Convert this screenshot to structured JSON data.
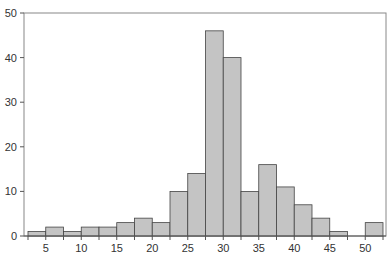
{
  "chart_data": {
    "type": "bar",
    "subtype": "histogram",
    "title": "",
    "xlabel": "",
    "ylabel": "",
    "bin_width": 2.5,
    "bin_edges": [
      2.5,
      5,
      7.5,
      10,
      12.5,
      15,
      17.5,
      20,
      22.5,
      25,
      27.5,
      30,
      32.5,
      35,
      37.5,
      40,
      42.5,
      45,
      47.5,
      50,
      52.5
    ],
    "values": [
      1,
      2,
      1,
      2,
      2,
      3,
      4,
      3,
      10,
      14,
      46,
      40,
      10,
      16,
      11,
      7,
      4,
      1,
      0,
      3
    ],
    "xlim": [
      2.5,
      52.5
    ],
    "ylim": [
      0,
      50
    ],
    "x_ticks": [
      5,
      10,
      15,
      20,
      25,
      30,
      35,
      40,
      45,
      50
    ],
    "y_ticks": [
      0,
      10,
      20,
      30,
      40,
      50
    ],
    "grid": false,
    "legend": null,
    "colors": {
      "bar_fill": "#c4c4c4",
      "bar_edge": "#444444",
      "axis": "#555555",
      "frame": "#888888"
    }
  }
}
